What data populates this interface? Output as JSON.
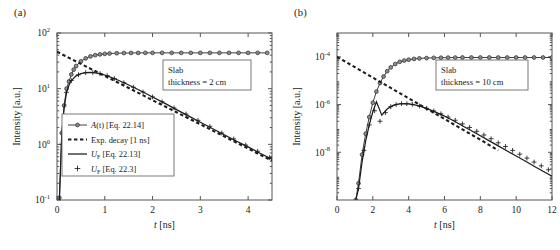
{
  "figure": {
    "panels": [
      {
        "id": "a",
        "label": "(a)",
        "annotation": {
          "line1": "Slab",
          "line2": "thickness = 2 cm"
        },
        "xaxis": {
          "title_symbol": "t",
          "title_unit": "[ns]",
          "min": 0,
          "max": 4.5,
          "ticks": [
            0,
            1,
            2,
            3,
            4
          ],
          "tick_labels": [
            "0",
            "1",
            "2",
            "3",
            "4"
          ]
        },
        "yaxis": {
          "title": "Intensity [a.u.]",
          "log": true,
          "exp_min": -1,
          "exp_max": 2,
          "tick_exponents": [
            -1,
            0,
            1,
            2
          ],
          "tick_labels": [
            "10",
            "10",
            "10",
            "10"
          ],
          "tick_sup": [
            "-1",
            "0",
            "1",
            "2"
          ]
        },
        "legend": {
          "entries": [
            {
              "style": "line-marker-circle",
              "text": "A(t) [Eq. 22.14]",
              "italic_head": "A",
              "rest": "(t) [Eq. 22.14]"
            },
            {
              "style": "dashed",
              "text": "Exp. decay [1 ns]"
            },
            {
              "style": "line",
              "text": "UF [Eq. 22.13]",
              "head": "U",
              "sub": "F",
              "rest": " [Eq. 22.13]"
            },
            {
              "style": "plus",
              "text": "UF [Eq. 22.3]",
              "head": "U",
              "sub": "F",
              "rest": " [Eq. 22.3]"
            }
          ]
        }
      },
      {
        "id": "b",
        "label": "(b)",
        "annotation": {
          "line1": "Slab",
          "line2": "thickness = 10 cm"
        },
        "xaxis": {
          "title_symbol": "t",
          "title_unit": "[ns]",
          "min": 0,
          "max": 12,
          "ticks": [
            0,
            2,
            4,
            6,
            8,
            10,
            12
          ],
          "tick_labels": [
            "0",
            "2",
            "4",
            "6",
            "8",
            "10",
            "12"
          ]
        },
        "yaxis": {
          "title": "Intensity [a.u.]",
          "log": true,
          "exp_min": -10,
          "exp_max": -3,
          "tick_exponents": [
            -8,
            -6,
            -4
          ],
          "tick_labels": [
            "10",
            "10",
            "10"
          ],
          "tick_sup": [
            "-8",
            "-6",
            "-4"
          ]
        }
      }
    ]
  },
  "chart_data": [
    {
      "type": "line",
      "panel": "a",
      "title": "",
      "xlabel": "t [ns]",
      "ylabel": "Intensity [a.u.]",
      "xlim": [
        0,
        4.5
      ],
      "ylim": [
        0.1,
        100
      ],
      "yscale": "log",
      "grid": false,
      "legend_position": "lower-left",
      "annotation": "Slab thickness = 2 cm",
      "series": [
        {
          "name": "A(t) [Eq. 22.14]",
          "marker": "circle",
          "linestyle": "solid",
          "x": [
            0.05,
            0.1,
            0.15,
            0.2,
            0.25,
            0.3,
            0.35,
            0.4,
            0.5,
            0.6,
            0.7,
            0.8,
            0.9,
            1.0,
            1.1,
            1.25,
            1.4,
            1.55,
            1.7,
            1.85,
            2.0,
            2.2,
            2.4,
            2.6,
            2.8,
            3.0,
            3.2,
            3.4,
            3.6,
            3.8,
            4.0,
            4.2,
            4.4
          ],
          "y": [
            0.11,
            1.6,
            5.0,
            10.0,
            13.5,
            18.0,
            22.0,
            25.5,
            31.0,
            35.0,
            38.0,
            40.0,
            41.3,
            42.2,
            42.8,
            43.3,
            43.6,
            43.8,
            43.9,
            44.0,
            44.0,
            44.0,
            44.0,
            44.0,
            44.0,
            44.0,
            44.0,
            44.0,
            44.0,
            44.0,
            44.0,
            44.0,
            44.0
          ]
        },
        {
          "name": "Exp. decay [1 ns]",
          "marker": "none",
          "linestyle": "dashed",
          "x": [
            0.0,
            0.25,
            0.5,
            0.75,
            1.0,
            1.25,
            1.5,
            1.75,
            2.0,
            2.25,
            2.5,
            2.75,
            3.0,
            3.25,
            3.5,
            3.75,
            4.0,
            4.25,
            4.5
          ],
          "y": [
            46.0,
            35.8,
            27.9,
            21.7,
            16.9,
            13.2,
            10.3,
            8.0,
            6.2,
            4.85,
            3.77,
            2.94,
            2.29,
            1.78,
            1.39,
            1.08,
            0.84,
            0.65,
            0.51
          ]
        },
        {
          "name": "UF [Eq. 22.13]",
          "marker": "none",
          "linestyle": "solid",
          "x": [
            0.05,
            0.1,
            0.15,
            0.2,
            0.25,
            0.3,
            0.4,
            0.5,
            0.6,
            0.7,
            0.8,
            0.9,
            1.0,
            1.2,
            1.4,
            1.6,
            1.8,
            2.0,
            2.25,
            2.5,
            2.75,
            3.0,
            3.25,
            3.5,
            3.75,
            4.0,
            4.25,
            4.5
          ],
          "y": [
            0.1,
            1.55,
            4.6,
            8.6,
            11.5,
            14.0,
            17.0,
            18.6,
            19.4,
            19.6,
            19.3,
            18.6,
            17.6,
            15.2,
            12.8,
            10.6,
            8.7,
            7.1,
            5.5,
            4.2,
            3.25,
            2.5,
            1.93,
            1.49,
            1.15,
            0.9,
            0.69,
            0.54
          ]
        },
        {
          "name": "UF [Eq. 22.3]",
          "marker": "plus",
          "linestyle": "none",
          "x": [
            0.1,
            0.2,
            0.3,
            0.45,
            0.6,
            0.75,
            0.9,
            1.05,
            1.2,
            1.4,
            1.6,
            1.8,
            2.0,
            2.2,
            2.45,
            2.7,
            2.95,
            3.2,
            3.45,
            3.7,
            3.95,
            4.2,
            4.45
          ],
          "y": [
            1.0,
            8.6,
            14.0,
            17.8,
            19.4,
            19.5,
            18.6,
            17.2,
            15.2,
            12.8,
            10.6,
            8.7,
            7.1,
            5.8,
            4.5,
            3.5,
            2.7,
            2.1,
            1.6,
            1.25,
            0.97,
            0.75,
            0.58
          ]
        }
      ]
    },
    {
      "type": "line",
      "panel": "b",
      "title": "",
      "xlabel": "t [ns]",
      "ylabel": "Intensity [a.u.]",
      "xlim": [
        0,
        12
      ],
      "ylim": [
        1e-10,
        0.001
      ],
      "yscale": "log",
      "grid": false,
      "annotation": "Slab thickness = 10 cm",
      "series": [
        {
          "name": "A(t) [Eq. 22.14]",
          "marker": "circle",
          "linestyle": "solid",
          "x": [
            1.05,
            1.2,
            1.4,
            1.6,
            1.8,
            2.0,
            2.2,
            2.4,
            2.6,
            2.8,
            3.0,
            3.25,
            3.5,
            3.75,
            4.0,
            4.3,
            4.6,
            5.0,
            5.4,
            5.8,
            6.2,
            6.6,
            7.0,
            7.5,
            8.0,
            8.5,
            9.0,
            9.5,
            10.0,
            10.5,
            11.0,
            11.5,
            12.0
          ],
          "y": [
            1e-10,
            5e-10,
            8e-09,
            6e-08,
            3e-07,
            1.2e-06,
            3.5e-06,
            8e-06,
            1.5e-05,
            2.5e-05,
            3.6e-05,
            5e-05,
            6.2e-05,
            7e-05,
            7.6e-05,
            8.2e-05,
            8.6e-05,
            8.9e-05,
            9.1e-05,
            9.2e-05,
            9.3e-05,
            9.35e-05,
            9.4e-05,
            9.4e-05,
            9.4e-05,
            9.4e-05,
            9.4e-05,
            9.4e-05,
            9.4e-05,
            9.4e-05,
            9.4e-05,
            9.4e-05,
            9.4e-05
          ]
        },
        {
          "name": "Exp. decay [1 ns]",
          "marker": "none",
          "linestyle": "dashed",
          "x": [
            0.0,
            0.5,
            1.0,
            1.5,
            2.0,
            2.5,
            3.0,
            3.5,
            4.0,
            4.5,
            5.0,
            5.5,
            6.0,
            6.5,
            7.0,
            7.5,
            8.0,
            8.5,
            9.0
          ],
          "y": [
            0.0001,
            6.1e-05,
            3.7e-05,
            2.23e-05,
            1.35e-05,
            8.2e-06,
            5e-06,
            3e-06,
            1.83e-06,
            1.11e-06,
            6.7e-07,
            4.1e-07,
            2.5e-07,
            1.5e-07,
            9.1e-08,
            5.5e-08,
            3.4e-08,
            2e-08,
            1.2e-08
          ]
        },
        {
          "name": "UF [Eq. 22.13]",
          "marker": "none",
          "linestyle": "solid",
          "x": [
            1.05,
            1.2,
            1.4,
            1.6,
            1.8,
            2.0,
            2.2,
            2.5,
            2.8,
            3.1,
            3.4,
            3.7,
            4.0,
            4.4,
            4.8,
            5.2,
            5.6,
            6.0,
            6.5,
            7.0,
            7.5,
            8.0,
            8.5,
            9.0,
            9.5,
            10.0,
            10.5,
            11.0,
            11.5,
            12.0
          ],
          "y": [
            1e-10,
            3e-10,
            4e-09,
            3e-08,
            1.4e-07,
            5e-07,
            1.3e-06,
            3.6e-07,
            6.5e-07,
            9e-07,
            1.05e-06,
            1.1e-06,
            1.08e-06,
            9.5e-07,
            7.8e-07,
            6e-07,
            4.5e-07,
            3.3e-07,
            2.1e-07,
            1.3e-07,
            8e-08,
            4.9e-08,
            3e-08,
            1.85e-08,
            1.13e-08,
            7e-09,
            4.3e-09,
            2.6e-09,
            1.6e-09,
            1e-09
          ]
        },
        {
          "name": "UF [Eq. 22.3]",
          "marker": "plus",
          "linestyle": "none",
          "x": [
            1.2,
            1.5,
            1.8,
            2.1,
            2.4,
            2.7,
            3.0,
            3.3,
            3.6,
            3.9,
            4.2,
            4.6,
            5.0,
            5.4,
            5.8,
            6.2,
            6.6,
            7.0,
            7.4,
            7.8,
            8.2,
            8.6,
            9.0,
            9.4,
            9.8,
            10.2,
            10.6,
            11.0,
            11.4,
            11.8
          ],
          "y": [
            3e-10,
            1.2e-08,
            1.4e-07,
            5.5e-07,
            2e-07,
            4.6e-07,
            8.2e-07,
            1e-06,
            1.1e-06,
            1.09e-06,
            1.02e-06,
            8.7e-07,
            7e-07,
            5.4e-07,
            4.1e-07,
            3e-07,
            2.2e-07,
            1.55e-07,
            1.1e-07,
            7.6e-08,
            5.3e-08,
            3.7e-08,
            2.5e-08,
            1.75e-08,
            1.2e-08,
            8.3e-09,
            5.7e-09,
            3.9e-09,
            2.7e-09,
            1.85e-09
          ]
        }
      ]
    }
  ]
}
